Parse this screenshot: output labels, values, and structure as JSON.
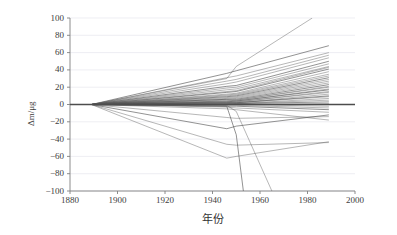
{
  "chart_data": {
    "type": "line",
    "title": "",
    "subtitle": "",
    "xlabel": "年份",
    "ylabel": "Δm/μg",
    "xlim": [
      1880,
      2000
    ],
    "ylim": [
      -100,
      100
    ],
    "xticks": [
      1880,
      1900,
      1920,
      1940,
      1960,
      1980,
      2000
    ],
    "yticks": [
      100,
      80,
      60,
      40,
      20,
      0,
      -20,
      -40,
      -60,
      -80,
      -100
    ],
    "xtick_labels": [
      "1880",
      "1900",
      "1920",
      "1940",
      "1960",
      "1980",
      "2000"
    ],
    "ytick_labels": [
      "100",
      "80",
      "60",
      "40",
      "20",
      "0",
      "−20",
      "−40",
      "−60",
      "−80",
      "−100"
    ],
    "grid": "horizontal",
    "legend": "none",
    "line_color": "#555555",
    "zero_line_color": "#4d4d4d",
    "gridline_color": "#e6e6ee",
    "axis_color": "#808080",
    "common_origin": {
      "x": 1889,
      "y": 0
    },
    "node_years": [
      1889,
      1946,
      1950,
      1989
    ],
    "series": [
      {
        "name": "K1",
        "x": [
          1889,
          1946,
          1950,
          1989
        ],
        "values": [
          0,
          36,
          39,
          68
        ]
      },
      {
        "name": "K2",
        "x": [
          1889,
          1946,
          1950,
          1989
        ],
        "values": [
          0,
          31,
          33,
          60
        ]
      },
      {
        "name": "K3",
        "x": [
          1889,
          1946,
          1950,
          1989
        ],
        "values": [
          0,
          27,
          29,
          57
        ]
      },
      {
        "name": "K4",
        "x": [
          1889,
          1946,
          1950,
          1989
        ],
        "values": [
          0,
          24,
          26,
          54
        ]
      },
      {
        "name": "K5",
        "x": [
          1889,
          1946,
          1950,
          1989
        ],
        "values": [
          0,
          21,
          22,
          50
        ]
      },
      {
        "name": "K6",
        "x": [
          1889,
          1946,
          1950,
          1989
        ],
        "values": [
          0,
          19,
          20,
          47
        ]
      },
      {
        "name": "K7",
        "x": [
          1889,
          1946,
          1950,
          1989
        ],
        "values": [
          0,
          17,
          18,
          44
        ]
      },
      {
        "name": "K8",
        "x": [
          1889,
          1946,
          1950,
          1989
        ],
        "values": [
          0,
          15,
          16,
          43
        ]
      },
      {
        "name": "K9",
        "x": [
          1889,
          1946,
          1950,
          1989
        ],
        "values": [
          0,
          14,
          15,
          41
        ]
      },
      {
        "name": "K10",
        "x": [
          1889,
          1946,
          1950,
          1989
        ],
        "values": [
          0,
          12,
          13,
          38
        ]
      },
      {
        "name": "K11",
        "x": [
          1889,
          1946,
          1950,
          1989
        ],
        "values": [
          0,
          11,
          12,
          35
        ]
      },
      {
        "name": "K12",
        "x": [
          1889,
          1946,
          1950,
          1989
        ],
        "values": [
          0,
          10,
          11,
          33
        ]
      },
      {
        "name": "K13",
        "x": [
          1889,
          1946,
          1950,
          1989
        ],
        "values": [
          0,
          9,
          10,
          31
        ]
      },
      {
        "name": "K14",
        "x": [
          1889,
          1946,
          1950,
          1989
        ],
        "values": [
          0,
          8,
          9,
          29
        ]
      },
      {
        "name": "K15",
        "x": [
          1889,
          1946,
          1950,
          1989
        ],
        "values": [
          0,
          7,
          8,
          27
        ]
      },
      {
        "name": "K16",
        "x": [
          1889,
          1946,
          1950,
          1989
        ],
        "values": [
          0,
          6,
          7,
          25
        ]
      },
      {
        "name": "K17",
        "x": [
          1889,
          1946,
          1950,
          1989
        ],
        "values": [
          0,
          6,
          6,
          23
        ]
      },
      {
        "name": "K18",
        "x": [
          1889,
          1946,
          1950,
          1989
        ],
        "values": [
          0,
          5,
          5,
          21
        ]
      },
      {
        "name": "K19",
        "x": [
          1889,
          1946,
          1950,
          1989
        ],
        "values": [
          0,
          4,
          5,
          20
        ]
      },
      {
        "name": "K20",
        "x": [
          1889,
          1946,
          1950,
          1989
        ],
        "values": [
          0,
          4,
          4,
          18
        ]
      },
      {
        "name": "K21",
        "x": [
          1889,
          1946,
          1950,
          1989
        ],
        "values": [
          0,
          3,
          4,
          17
        ]
      },
      {
        "name": "K22",
        "x": [
          1889,
          1946,
          1950,
          1989
        ],
        "values": [
          0,
          3,
          3,
          15
        ]
      },
      {
        "name": "K23",
        "x": [
          1889,
          1946,
          1950,
          1989
        ],
        "values": [
          0,
          2,
          3,
          14
        ]
      },
      {
        "name": "K24",
        "x": [
          1889,
          1946,
          1950,
          1989
        ],
        "values": [
          0,
          2,
          2,
          12
        ]
      },
      {
        "name": "K25",
        "x": [
          1889,
          1946,
          1950,
          1989
        ],
        "values": [
          0,
          2,
          2,
          10
        ]
      },
      {
        "name": "K26",
        "x": [
          1889,
          1946,
          1950,
          1989
        ],
        "values": [
          0,
          1,
          2,
          9
        ]
      },
      {
        "name": "K27",
        "x": [
          1889,
          1946,
          1950,
          1989
        ],
        "values": [
          0,
          1,
          1,
          7
        ]
      },
      {
        "name": "K28",
        "x": [
          1889,
          1946,
          1950,
          1989
        ],
        "values": [
          0,
          1,
          1,
          5
        ]
      },
      {
        "name": "K29",
        "x": [
          1889,
          1946,
          1950,
          1989
        ],
        "values": [
          0,
          0,
          1,
          3
        ]
      },
      {
        "name": "K30",
        "x": [
          1889,
          1946,
          1950,
          1989
        ],
        "values": [
          0,
          0,
          0,
          1
        ]
      },
      {
        "name": "K31",
        "x": [
          1889,
          1946,
          1950,
          1989
        ],
        "values": [
          0,
          0,
          0,
          -2
        ]
      },
      {
        "name": "K32",
        "x": [
          1889,
          1946,
          1950,
          1989
        ],
        "values": [
          0,
          -1,
          -1,
          -4
        ]
      },
      {
        "name": "K33",
        "x": [
          1889,
          1946,
          1950,
          1989
        ],
        "values": [
          0,
          -2,
          -2,
          -6
        ]
      },
      {
        "name": "K34",
        "x": [
          1889,
          1946,
          1950,
          1989
        ],
        "values": [
          0,
          -3,
          -4,
          -9
        ]
      },
      {
        "name": "K35",
        "x": [
          1889,
          1946,
          1950,
          1989
        ],
        "values": [
          0,
          -5,
          -6,
          -18
        ]
      },
      {
        "name": "K36",
        "x": [
          1889,
          1946,
          1950,
          1989
        ],
        "values": [
          0,
          -15,
          -16,
          -14
        ]
      },
      {
        "name": "K37",
        "x": [
          1889,
          1946,
          1950,
          1989
        ],
        "values": [
          0,
          -28,
          -25,
          -12
        ]
      },
      {
        "name": "K38",
        "x": [
          1889,
          1946,
          1950,
          1989
        ],
        "values": [
          0,
          -46,
          -47,
          -44
        ]
      },
      {
        "name": "K39",
        "x": [
          1889,
          1946,
          1950,
          1989
        ],
        "values": [
          0,
          -62,
          -60,
          -43
        ]
      },
      {
        "name": "K40-steep-up",
        "x": [
          1889,
          1946,
          1950,
          1982
        ],
        "values": [
          0,
          30,
          44,
          100
        ]
      },
      {
        "name": "K41-steep-down",
        "x": [
          1889,
          1946,
          1950,
          1953
        ],
        "values": [
          0,
          -2,
          -35,
          -100
        ]
      },
      {
        "name": "K42-steep-down",
        "x": [
          1889,
          1946,
          1950,
          1965
        ],
        "values": [
          0,
          -1,
          -8,
          -100
        ]
      }
    ]
  },
  "axis": {
    "ylabel_text": "Δm/μg",
    "xlabel_text": "年份"
  }
}
